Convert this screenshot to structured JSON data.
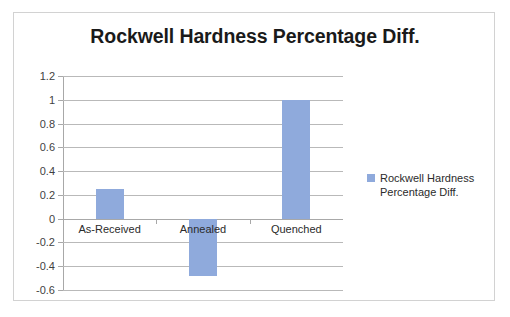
{
  "chart_data": {
    "type": "bar",
    "title": "Rockwell Hardness Percentage Diff.",
    "categories": [
      "As-Received",
      "Annealed",
      "Quenched"
    ],
    "values": [
      0.25,
      -0.48,
      1.0
    ],
    "series": [
      {
        "name": "Rockwell Hardness Percentage Diff.",
        "values": [
          0.25,
          -0.48,
          1.0
        ]
      }
    ],
    "xlabel": "",
    "ylabel": "",
    "ylim": [
      -0.6,
      1.2
    ],
    "y_ticks": [
      1.2,
      1,
      0.8,
      0.6,
      0.4,
      0.2,
      0,
      -0.2,
      -0.4,
      -0.6
    ],
    "y_tick_labels": [
      "1.2",
      "1",
      "0.8",
      "0.6",
      "0.4",
      "0.2",
      "0",
      "-0.2",
      "-0.4",
      "-0.6"
    ],
    "grid": true,
    "legend": {
      "position": "right",
      "entries": [
        {
          "label_line1": "Rockwell Hardness",
          "label_line2": "Percentage Diff.",
          "color": "#8faadc",
          "marker": "legend-swatch-icon"
        }
      ]
    },
    "colors": {
      "bar": "#8faadc",
      "gridline": "#b9b9b9",
      "axis": "#a8a8a8",
      "title_text": "#1a1a1a",
      "label_text": "#3f3f3f",
      "frame_border": "#d2d2d2",
      "background": "#ffffff"
    }
  }
}
